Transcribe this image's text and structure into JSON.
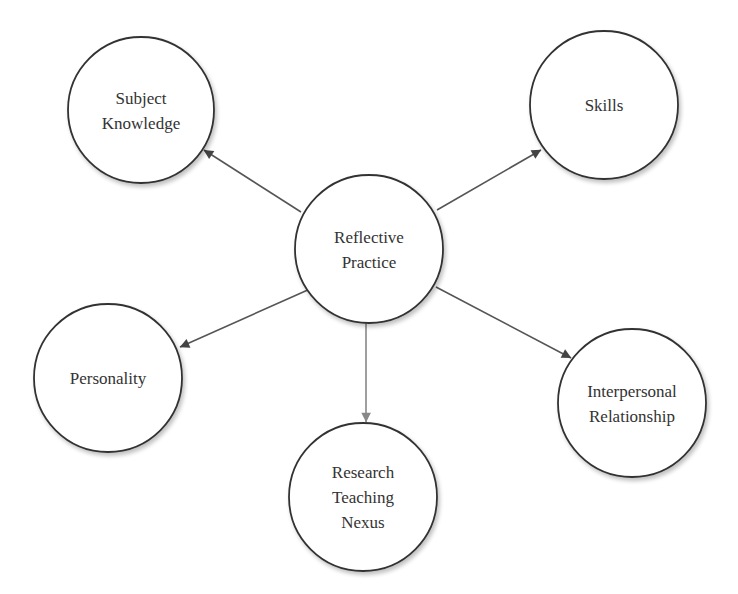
{
  "diagram": {
    "type": "hub-and-spoke concept map",
    "center": {
      "id": "reflective-practice",
      "lines": [
        "Reflective",
        "Practice"
      ],
      "cx": 369,
      "cy": 249,
      "r": 74
    },
    "nodes": [
      {
        "id": "subject-knowledge",
        "lines": [
          "Subject",
          "Knowledge"
        ],
        "cx": 141,
        "cy": 110,
        "r": 73
      },
      {
        "id": "skills",
        "lines": [
          "Skills"
        ],
        "cx": 604,
        "cy": 105,
        "r": 74
      },
      {
        "id": "personality",
        "lines": [
          "Personality"
        ],
        "cx": 108,
        "cy": 378,
        "r": 74
      },
      {
        "id": "research-teaching-nexus",
        "lines": [
          "Research",
          "Teaching",
          "Nexus"
        ],
        "cx": 363,
        "cy": 497,
        "r": 74
      },
      {
        "id": "interpersonal-relationship",
        "lines": [
          "Interpersonal",
          "Relationship"
        ],
        "cx": 632,
        "cy": 403,
        "r": 74
      }
    ],
    "edges": [
      {
        "from": "reflective-practice",
        "to": "subject-knowledge",
        "x1": 301,
        "y1": 212,
        "x2": 204,
        "y2": 150,
        "color": "#555555"
      },
      {
        "from": "reflective-practice",
        "to": "skills",
        "x1": 437,
        "y1": 210,
        "x2": 541,
        "y2": 150,
        "color": "#555555"
      },
      {
        "from": "reflective-practice",
        "to": "personality",
        "x1": 310,
        "y1": 289,
        "x2": 180,
        "y2": 347,
        "color": "#555555"
      },
      {
        "from": "reflective-practice",
        "to": "research-teaching-nexus",
        "x1": 366,
        "y1": 323,
        "x2": 366,
        "y2": 422,
        "color": "#888888"
      },
      {
        "from": "reflective-practice",
        "to": "interpersonal-relationship",
        "x1": 436,
        "y1": 287,
        "x2": 571,
        "y2": 358,
        "color": "#555555"
      }
    ],
    "colors": {
      "circle_stroke": "#333333",
      "circle_fill": "#ffffff",
      "text": "#333333",
      "arrow": "#555555",
      "arrow_light": "#888888"
    }
  }
}
